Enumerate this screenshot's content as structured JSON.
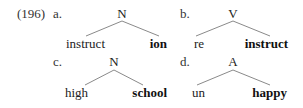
{
  "example_number": "(196)",
  "trees": [
    {
      "label": "a.",
      "root": "N",
      "left": "instruct",
      "right": "ion",
      "head": "right"
    },
    {
      "label": "b.",
      "root": "V",
      "left": "re",
      "right": "instruct",
      "head": "right"
    },
    {
      "label": "c.",
      "root": "N",
      "left": "high",
      "right": "school",
      "head": "right"
    },
    {
      "label": "d.",
      "root": "A",
      "left": "un",
      "right": "happy",
      "head": "right"
    }
  ]
}
